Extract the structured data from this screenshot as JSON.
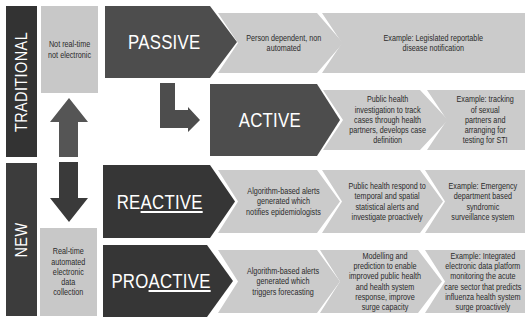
{
  "eras": {
    "traditional": "TRADITIONAL",
    "new": "NEW"
  },
  "data_collection": {
    "traditional": "Not real-time\nnot electronic",
    "new": "Real-time\nautomated\nelectronic\ndata\ncollection"
  },
  "transitions": {
    "up_arrow": "arrow-up",
    "down_arrow": "arrow-down",
    "passive_to_active": "arrow-elbow-right"
  },
  "colors": {
    "dark_box": "#4d4d4d",
    "dark_box_new": "#363636",
    "light_box": "#cbcbcb",
    "era_bar": "#333333",
    "text_light": "#ffffff",
    "text_dark": "#2a2a2a"
  },
  "rows": [
    {
      "id": "passive",
      "title": {
        "plain": "PASSIVE",
        "underlined": ""
      },
      "steps": [
        "Person dependent, non\nautomated",
        "Example: Legislated reportable\ndisease notification"
      ]
    },
    {
      "id": "active",
      "title": {
        "plain": "ACTIVE",
        "underlined": ""
      },
      "steps": [
        "Public health\ninvestigation to track\ncases through health\npartners, develops case\ndefinition",
        "Example: tracking\nof sexual\npartners and\narranging for\ntesting for STI"
      ]
    },
    {
      "id": "reactive",
      "title": {
        "plain": "RE",
        "underlined": "ACTIVE"
      },
      "steps": [
        "Algorithm-based alerts\ngenerated which\nnotifies epidemiologists",
        "Public health respond to\ntemporal and spatial\nstatistical alerts and\ninvestigate proactively",
        "Example: Emergency\ndepartment based\nsyndromic\nsurveillance system"
      ]
    },
    {
      "id": "proactive",
      "title": {
        "plain": "PRO",
        "underlined": "ACTIVE"
      },
      "steps": [
        "Algorithm-based alerts\ngenerated which\ntriggers forecasting",
        "Modelling and\nprediction to enable\nimproved public health\nand health system\nresponse, improve\nsurge capacity",
        "Example: Integrated\nelectronic data platform\nmonitoring the acute\ncare sector that predicts\ninfluenza health system\nsurge proactively"
      ]
    }
  ]
}
